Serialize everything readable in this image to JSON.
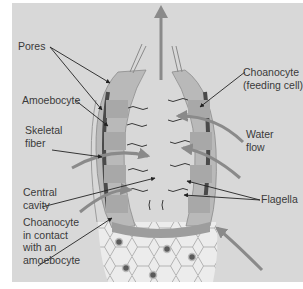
{
  "figure": {
    "background_color": "#d8d8d8",
    "body_wall_color": "#7a7a7a",
    "labels": {
      "pores": "Pores",
      "amoebocyte": "Amoebocyte",
      "skeletal_fiber": [
        "Skeletal",
        "fiber"
      ],
      "central_cavity": [
        "Central",
        "cavity"
      ],
      "choanocyte_amoebocyte": [
        "Choanocyte",
        "in contact",
        "with an",
        "amoebocyte"
      ],
      "choanocyte": [
        "Choanocyte",
        "(feeding cell)"
      ],
      "water_flow": [
        "Water",
        "flow"
      ],
      "flagella": "Flagella"
    },
    "icons": {
      "water_out_arrow": "arrow-up",
      "water_in_arrows": "curved-arrow"
    }
  }
}
